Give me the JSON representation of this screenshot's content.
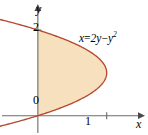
{
  "figure": {
    "title": "",
    "background_color": "#ffffff"
  },
  "axes": {
    "x_axis_label": "x",
    "y_axis_label": "y",
    "origin_label": "0",
    "x_ticks": [
      {
        "value": 1,
        "label": "1"
      }
    ],
    "y_ticks": [
      {
        "value": 2,
        "label": "2"
      }
    ]
  },
  "curve": {
    "equation_text": "x = 2y − y",
    "equation_var": "x",
    "equation_eq": "=",
    "equation_rhs_a": "2y",
    "equation_minus": "−",
    "equation_rhs_b": "y",
    "equation_exponent": "2",
    "color": "#b5492f",
    "fill_color": "#f7e0bd"
  },
  "chart_data": {
    "type": "line",
    "title": "",
    "xlabel": "x",
    "ylabel": "y",
    "grid": false,
    "legend": null,
    "xlim": [
      -0.55,
      1.6
    ],
    "ylim": [
      -0.45,
      2.7
    ],
    "annotations": [
      {
        "text": "x = 2y - y^2",
        "x": 1.05,
        "y": 2.05
      }
    ],
    "series": [
      {
        "name": "x = 2y - y^2",
        "color": "#b5492f",
        "fill": "#f7e0bd",
        "fill_region": "between curve and y-axis for 0 <= y <= 2",
        "y": [
          -0.42,
          -0.2,
          0.0,
          0.25,
          0.5,
          0.75,
          1.0,
          1.25,
          1.5,
          1.75,
          2.0,
          2.25,
          2.5,
          2.62
        ],
        "x": [
          -1.016,
          -0.44,
          0.0,
          0.4375,
          0.75,
          0.9375,
          1.0,
          0.9375,
          0.75,
          0.4375,
          0.0,
          -0.5625,
          -1.25,
          -1.6244
        ]
      }
    ]
  }
}
